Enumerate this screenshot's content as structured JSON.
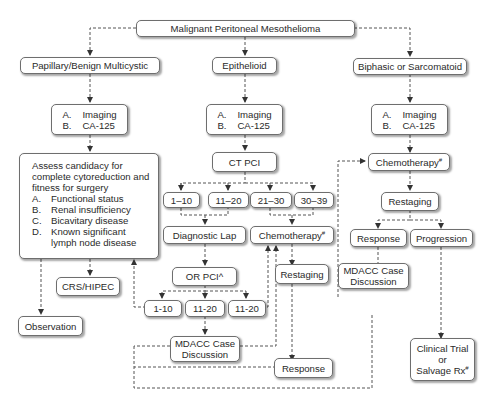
{
  "title": "Malignant Peritoneal Mesothelioma",
  "branches": {
    "papillary": {
      "label": "Papillary/Benign Multicystic",
      "workup": [
        {
          "key": "A.",
          "text": "Imaging"
        },
        {
          "key": "B.",
          "text": "CA-125"
        }
      ],
      "assess": {
        "intro": "Assess candidacy for complete cytoreduction and fitness for surgery",
        "items": [
          {
            "key": "A.",
            "text": "Functional status"
          },
          {
            "key": "B.",
            "text": "Renal insufficiency"
          },
          {
            "key": "C.",
            "text": "Bicavitary disease"
          },
          {
            "key": "D.",
            "text": "Known significant lymph node disease"
          }
        ]
      },
      "crs": "CRS/HIPEC",
      "observation": "Observation"
    },
    "epithelioid": {
      "label": "Epithelioid",
      "workup": [
        {
          "key": "A.",
          "text": "Imaging"
        },
        {
          "key": "B.",
          "text": "CA-125"
        }
      ],
      "ct_pci": "CT PCI",
      "pci_ranges": [
        "1–10",
        "11–20",
        "21–30",
        "30–39"
      ],
      "diagnostic_lap": "Diagnostic Lap",
      "chemotherapy": "Chemotherapy",
      "chemotherapy_mark": "#",
      "or_pci": "OR PCI^",
      "or_pci_ranges": [
        "1-10",
        "11-20",
        "11-20"
      ],
      "restaging": "Restaging",
      "mdacc": "MDACC Case Discussion",
      "response": "Response"
    },
    "biphasic": {
      "label": "Biphasic or Sarcomatoid",
      "workup": [
        {
          "key": "A.",
          "text": "Imaging"
        },
        {
          "key": "B.",
          "text": "CA-125"
        }
      ],
      "chemotherapy": "Chemotherapy",
      "chemotherapy_mark": "#",
      "restaging": "Restaging",
      "response": "Response",
      "progression": "Progression",
      "mdacc": "MDACC Case Discussion",
      "clinical_trial": "Clinical Trial",
      "or_text": "or",
      "salvage": "Salvage Rx",
      "salvage_mark": "#"
    }
  }
}
